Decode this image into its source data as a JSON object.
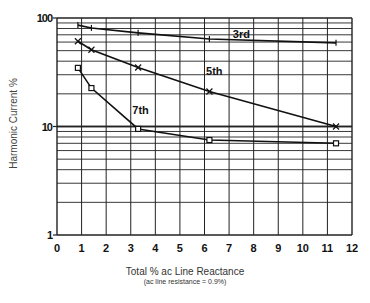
{
  "chart_data": {
    "type": "line",
    "title": "",
    "xlabel": "Total % ac Line Reactance",
    "xlabel_note": "(ac line resistance = 0.9%)",
    "ylabel": "Harmonic Current %",
    "xlim": [
      0,
      12
    ],
    "ylim": [
      1,
      100
    ],
    "yscale": "log",
    "grid": true,
    "x_ticks": [
      "0",
      "1",
      "2",
      "3",
      "4",
      "5",
      "6",
      "7",
      "8",
      "9",
      "10",
      "11",
      "12"
    ],
    "y_ticks": [
      "1",
      "10",
      "100"
    ],
    "series": [
      {
        "name": "3rd",
        "x": [
          0.85,
          1.4,
          3.3,
          6.2,
          11.35
        ],
        "values": [
          86,
          81,
          73,
          64,
          59
        ],
        "marker": "plus"
      },
      {
        "name": "5th",
        "x": [
          0.85,
          1.4,
          3.3,
          6.2,
          11.35
        ],
        "values": [
          61,
          51,
          35,
          21,
          10
        ],
        "marker": "x"
      },
      {
        "name": "7th",
        "x": [
          0.85,
          1.4,
          3.3,
          6.2,
          11.35
        ],
        "values": [
          34.7,
          22.6,
          9.5,
          7.5,
          7.0
        ],
        "marker": "square"
      }
    ],
    "annotations": [
      {
        "text": "3rd",
        "x": 7.5,
        "y": 66
      },
      {
        "text": "5th",
        "x": 6.4,
        "y": 30
      },
      {
        "text": "7th",
        "x": 3.4,
        "y": 13
      }
    ]
  }
}
